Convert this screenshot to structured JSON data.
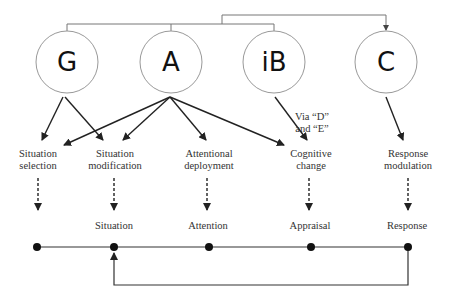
{
  "nodes": [
    {
      "id": "G",
      "label": "G",
      "cx": 67,
      "cy": 62
    },
    {
      "id": "A",
      "label": "A",
      "cx": 171,
      "cy": 62
    },
    {
      "id": "iB",
      "label": "iB",
      "cx": 274,
      "cy": 62
    },
    {
      "id": "C",
      "label": "C",
      "cx": 386,
      "cy": 62
    }
  ],
  "strategies": [
    {
      "line1": "Situation",
      "line2": "selection"
    },
    {
      "line1": "Situation",
      "line2": "modification"
    },
    {
      "line1": "Attentional",
      "line2": "deployment"
    },
    {
      "line1": "Cognitive",
      "line2": "change"
    },
    {
      "line1": "Response",
      "line2": "modulation"
    }
  ],
  "annotation": {
    "line1": "Via “D”",
    "line2": "and “E”"
  },
  "stages": [
    "Situation",
    "Attention",
    "Appraisal",
    "Response"
  ],
  "colors": {
    "stroke": "#222222",
    "circle": "#888888",
    "connector": "#777777"
  }
}
